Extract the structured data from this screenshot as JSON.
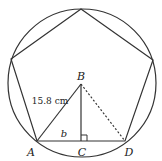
{
  "diagram": {
    "points": {
      "A": {
        "label": "A"
      },
      "B": {
        "label": "B"
      },
      "C": {
        "label": "C"
      },
      "D": {
        "label": "D"
      }
    },
    "labels": {
      "hypotenuse": "15.8 cm",
      "base": "b"
    },
    "colors": {
      "stroke": "#333333",
      "background": "#ffffff"
    }
  }
}
